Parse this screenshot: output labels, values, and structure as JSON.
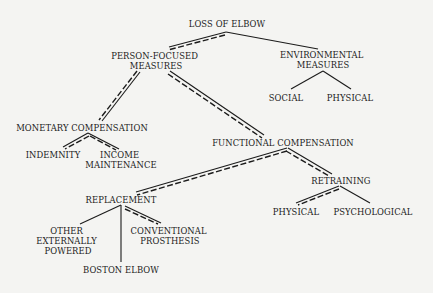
{
  "title": "LOSS OF ELBOW",
  "nodes": {
    "root": {
      "lines": [
        "LOSS OF ELBOW"
      ]
    },
    "person_focused": {
      "lines": [
        "PERSON-FOCUSED",
        "MEASURES"
      ]
    },
    "environmental": {
      "lines": [
        "ENVIRONMENTAL",
        "MEASURES"
      ]
    },
    "social": {
      "lines": [
        "SOCIAL"
      ]
    },
    "env_physical": {
      "lines": [
        "PHYSICAL"
      ]
    },
    "monetary": {
      "lines": [
        "MONETARY COMPENSATION"
      ]
    },
    "indemnity": {
      "lines": [
        "INDEMNITY"
      ]
    },
    "income": {
      "lines": [
        "INCOME",
        "MAINTENANCE"
      ]
    },
    "functional": {
      "lines": [
        "FUNCTIONAL COMPENSATION"
      ]
    },
    "replacement": {
      "lines": [
        "REPLACEMENT"
      ]
    },
    "retraining": {
      "lines": [
        "RETRAINING"
      ]
    },
    "ret_physical": {
      "lines": [
        "PHYSICAL"
      ]
    },
    "psychological": {
      "lines": [
        "PSYCHOLOGICAL"
      ]
    },
    "other_ext": {
      "lines": [
        "OTHER",
        "EXTERNALLY",
        "POWERED"
      ]
    },
    "conventional": {
      "lines": [
        "CONVENTIONAL",
        "PROSTHESIS"
      ]
    },
    "boston": {
      "lines": [
        "BOSTON ELBOW"
      ]
    }
  },
  "edges": [
    {
      "from": "root",
      "to": "person_focused",
      "style": "highlighted"
    },
    {
      "from": "root",
      "to": "environmental",
      "style": "plain"
    },
    {
      "from": "environmental",
      "to": "social",
      "style": "plain"
    },
    {
      "from": "environmental",
      "to": "env_physical",
      "style": "plain"
    },
    {
      "from": "person_focused",
      "to": "monetary",
      "style": "highlighted"
    },
    {
      "from": "person_focused",
      "to": "functional",
      "style": "highlighted"
    },
    {
      "from": "monetary",
      "to": "indemnity",
      "style": "highlighted"
    },
    {
      "from": "monetary",
      "to": "income",
      "style": "highlighted"
    },
    {
      "from": "functional",
      "to": "replacement",
      "style": "highlighted"
    },
    {
      "from": "functional",
      "to": "retraining",
      "style": "highlighted"
    },
    {
      "from": "retraining",
      "to": "ret_physical",
      "style": "highlighted"
    },
    {
      "from": "retraining",
      "to": "psychological",
      "style": "plain"
    },
    {
      "from": "replacement",
      "to": "other_ext",
      "style": "plain"
    },
    {
      "from": "replacement",
      "to": "boston",
      "style": "plain"
    },
    {
      "from": "replacement",
      "to": "conventional",
      "style": "highlighted"
    }
  ],
  "legend": {
    "highlighted": "double line (solid + dashed)",
    "plain": "single solid line"
  },
  "colors": {
    "ink": "#1b1b1b",
    "paper": "#f4f4f2"
  }
}
